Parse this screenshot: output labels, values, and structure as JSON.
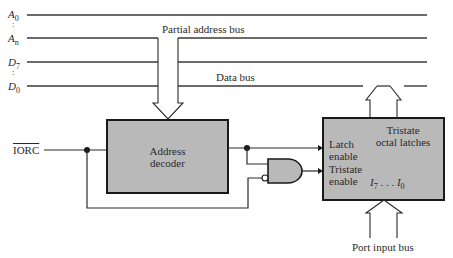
{
  "diagram": {
    "bus_labels": {
      "address_top": {
        "main": "A",
        "sub": "0"
      },
      "address_bottom": {
        "main": "A",
        "sub": "n"
      },
      "data_top": {
        "main": "D",
        "sub": "7"
      },
      "data_bottom": {
        "main": "D",
        "sub": "0"
      },
      "dots": ":"
    },
    "partial_address_bus": "Partial address bus",
    "data_bus": "Data bus",
    "iorc_signal": "IORC",
    "address_decoder": {
      "line1": "Address",
      "line2": "decoder"
    },
    "latch_block": {
      "title_line1": "Tristate",
      "title_line2": "octal latches",
      "latch_enable_line1": "Latch",
      "latch_enable_line2": "enable",
      "tristate_enable_line1": "Tristate",
      "tristate_enable_line2": "enable",
      "inputs": {
        "first": "I",
        "first_sub": "7",
        "dots": " . . . ",
        "last": "I",
        "last_sub": "0"
      }
    },
    "port_input_bus": "Port input bus",
    "colors": {
      "block_fill": "#b9b9b9",
      "line": "#2a2a2a",
      "background": "#ffffff"
    }
  }
}
